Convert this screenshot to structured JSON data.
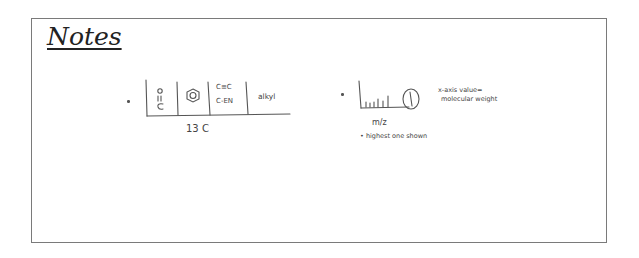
{
  "title": "Notes",
  "nmr_sketch": {
    "cells": [
      {
        "label": "C=O",
        "note": "carbonyl drawn vertical"
      },
      {
        "label": "benzene ring"
      },
      {
        "label_1": "C≡C",
        "label_2": "C-EN"
      },
      {
        "label": "alkyl"
      }
    ],
    "axis_label": "13C",
    "cell_c3_line1": "C≡C",
    "cell_c3_line2": "C-EN",
    "cell_c4": "alkyl",
    "caption": "13 C"
  },
  "ms_sketch": {
    "axis_label": "m/z",
    "peak_label": "1",
    "note_line1": "x-axis value=",
    "note_line2": "molecular weight",
    "footnote": "• highest one shown"
  }
}
